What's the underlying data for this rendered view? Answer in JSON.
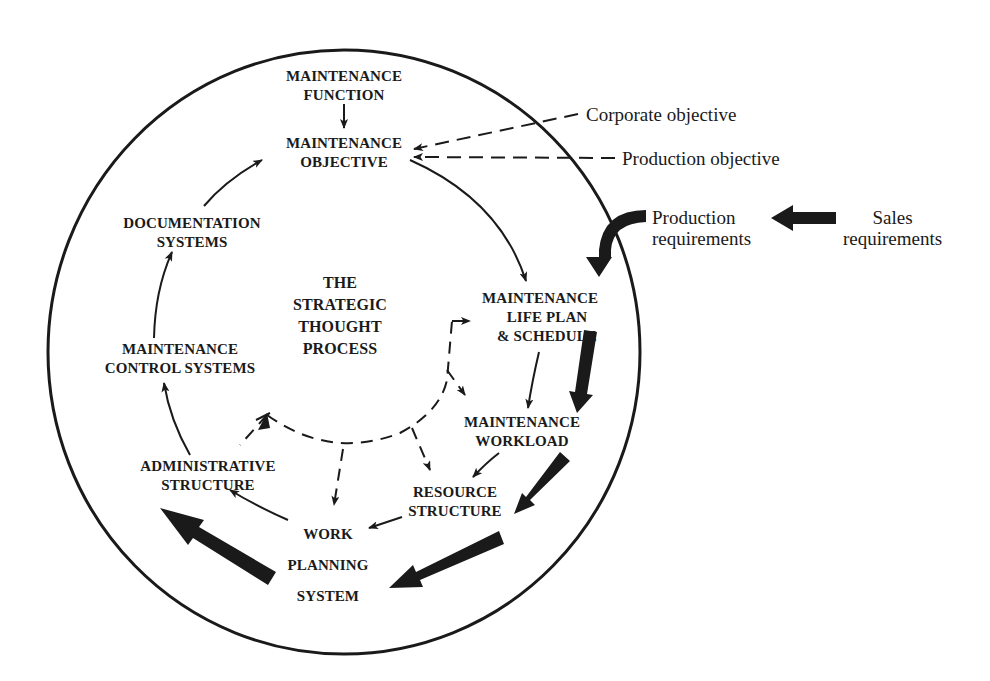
{
  "diagram": {
    "center_title": [
      "THE",
      "STRATEGIC",
      "THOUGHT",
      "PROCESS"
    ],
    "nodes": {
      "maintenance_function": [
        "MAINTENANCE",
        "FUNCTION"
      ],
      "maintenance_objective": [
        "MAINTENANCE",
        "OBJECTIVE"
      ],
      "documentation_systems": [
        "DOCUMENTATION",
        "SYSTEMS"
      ],
      "maintenance_control_systems": [
        "MAINTENANCE",
        "CONTROL SYSTEMS"
      ],
      "administrative_structure": [
        "ADMINISTRATIVE",
        "STRUCTURE"
      ],
      "work_planning_system": [
        "WORK",
        "PLANNING",
        "SYSTEM"
      ],
      "resource_structure": [
        "RESOURCE",
        "STRUCTURE"
      ],
      "maintenance_workload": [
        "MAINTENANCE",
        "WORKLOAD"
      ],
      "maintenance_life_plan": [
        "MAINTENANCE",
        "LIFE PLAN",
        "& SCHEDULE"
      ]
    },
    "external_inputs": {
      "corporate_objective": "Corporate objective",
      "production_objective": "Production objective",
      "production_requirements": [
        "Production",
        "requirements"
      ],
      "sales_requirements": [
        "Sales",
        "requirements"
      ]
    },
    "edges": [
      {
        "from": "MAINTENANCE FUNCTION",
        "to": "MAINTENANCE OBJECTIVE",
        "style": "solid"
      },
      {
        "from": "MAINTENANCE OBJECTIVE",
        "to": "MAINTENANCE LIFE PLAN & SCHEDULE",
        "style": "solid"
      },
      {
        "from": "MAINTENANCE LIFE PLAN & SCHEDULE",
        "to": "MAINTENANCE WORKLOAD",
        "style": "solid"
      },
      {
        "from": "MAINTENANCE WORKLOAD",
        "to": "RESOURCE STRUCTURE",
        "style": "solid"
      },
      {
        "from": "RESOURCE STRUCTURE",
        "to": "WORK PLANNING SYSTEM",
        "style": "solid"
      },
      {
        "from": "WORK PLANNING SYSTEM",
        "to": "ADMINISTRATIVE STRUCTURE",
        "style": "solid"
      },
      {
        "from": "ADMINISTRATIVE STRUCTURE",
        "to": "MAINTENANCE CONTROL SYSTEMS",
        "style": "solid"
      },
      {
        "from": "MAINTENANCE CONTROL SYSTEMS",
        "to": "DOCUMENTATION SYSTEMS",
        "style": "solid"
      },
      {
        "from": "DOCUMENTATION SYSTEMS",
        "to": "MAINTENANCE OBJECTIVE",
        "style": "solid"
      },
      {
        "from": "Corporate objective",
        "to": "MAINTENANCE OBJECTIVE",
        "style": "dashed"
      },
      {
        "from": "Production objective",
        "to": "MAINTENANCE OBJECTIVE",
        "style": "dashed"
      },
      {
        "from": "Sales requirements",
        "to": "Production requirements",
        "style": "bold"
      },
      {
        "from": "Production requirements",
        "to": "MAINTENANCE LIFE PLAN & SCHEDULE",
        "style": "bold"
      },
      {
        "from": "MAINTENANCE LIFE PLAN & SCHEDULE",
        "to": "MAINTENANCE WORKLOAD",
        "style": "bold"
      },
      {
        "from": "MAINTENANCE WORKLOAD",
        "to": "RESOURCE STRUCTURE",
        "style": "bold"
      },
      {
        "from": "RESOURCE STRUCTURE",
        "to": "WORK PLANNING SYSTEM",
        "style": "bold"
      },
      {
        "from": "WORK PLANNING SYSTEM",
        "to": "ADMINISTRATIVE STRUCTURE",
        "style": "bold"
      },
      {
        "from": "THE STRATEGIC THOUGHT PROCESS",
        "to": "MAINTENANCE LIFE PLAN & SCHEDULE",
        "style": "dashed"
      },
      {
        "from": "THE STRATEGIC THOUGHT PROCESS",
        "to": "MAINTENANCE WORKLOAD",
        "style": "dashed"
      },
      {
        "from": "THE STRATEGIC THOUGHT PROCESS",
        "to": "RESOURCE STRUCTURE",
        "style": "dashed"
      },
      {
        "from": "THE STRATEGIC THOUGHT PROCESS",
        "to": "WORK PLANNING SYSTEM",
        "style": "dashed"
      },
      {
        "from": "THE STRATEGIC THOUGHT PROCESS",
        "to": "ADMINISTRATIVE STRUCTURE",
        "style": "dashed"
      }
    ],
    "colors": {
      "ink": "#1a1a1a",
      "background": "#ffffff"
    }
  }
}
